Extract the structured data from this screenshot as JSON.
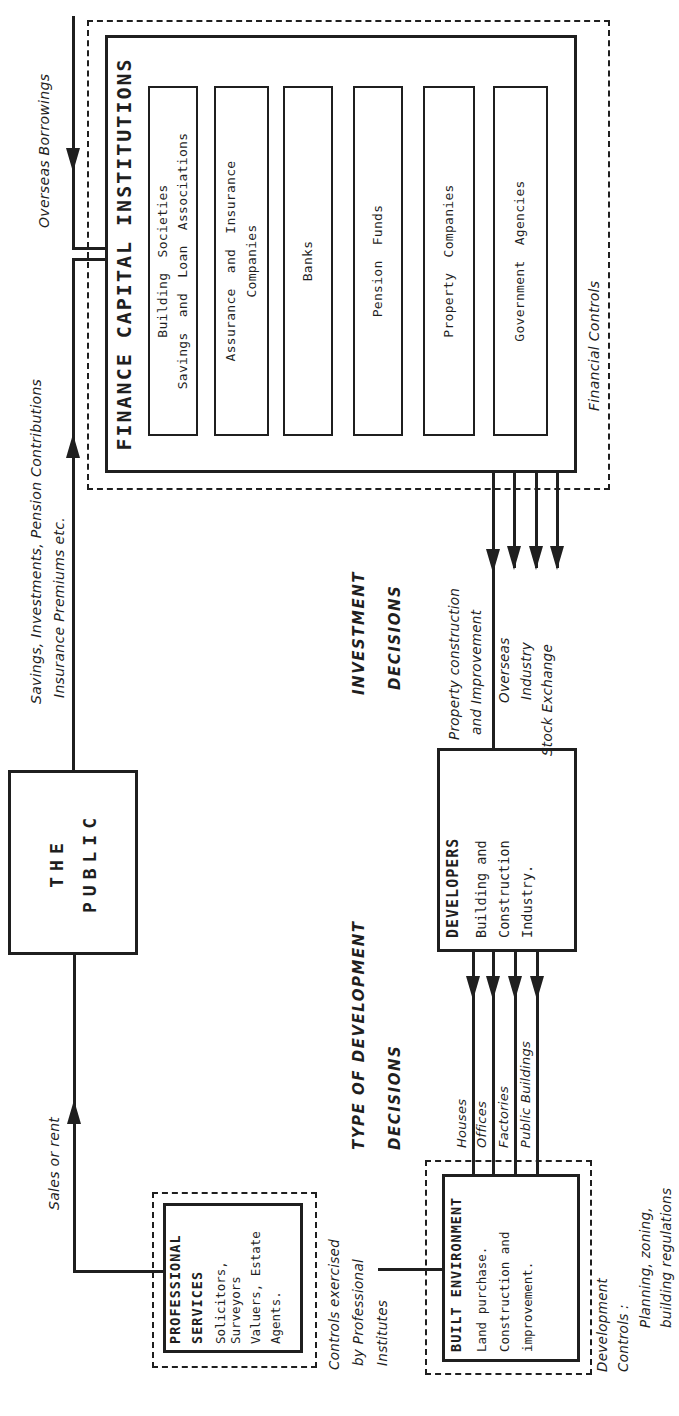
{
  "colors": {
    "ink": "#1f1f1f",
    "paper": "#ffffff"
  },
  "public_box": {
    "line1": "THE",
    "line2": "PUBLIC"
  },
  "fci": {
    "title": "FINANCE CAPITAL INSTITUTIONS",
    "outer_label": "Financial Controls",
    "sub_boxes": [
      {
        "line1": "Building Societies",
        "line2": "Savings and Loan Associations"
      },
      {
        "line1": "Assurance and Insurance",
        "line2": "Companies"
      },
      {
        "line1": "Banks"
      },
      {
        "line1": "Pension Funds"
      },
      {
        "line1": "Property Companies"
      },
      {
        "line1": "Government Agencies"
      }
    ]
  },
  "developers": {
    "title": "DEVELOPERS",
    "lines": [
      "Building and",
      "Construction",
      "Industry."
    ]
  },
  "professional": {
    "title_line1": "PROFESSIONAL",
    "title_line2": "SERVICES",
    "lines": [
      "Solicitors, Surveyors",
      "Valuers, Estate",
      "Agents."
    ]
  },
  "built_environment": {
    "title": "BUILT ENVIRONMENT",
    "lines": [
      "Land purchase.",
      "Construction and",
      "improvement."
    ]
  },
  "flow_labels": {
    "overseas_borrowings": "Overseas Borrowings",
    "savings_line1": "Savings, Investments, Pension Contributions",
    "savings_line2": "Insurance Premiums etc.",
    "sales_or_rent": "Sales or rent",
    "investment_line1": "INVESTMENT",
    "investment_line2": "DECISIONS",
    "type_line1": "TYPE OF DEVELOPMENT",
    "type_line2": "DECISIONS",
    "financial_controls": "Financial Controls"
  },
  "fci_outputs": {
    "property_line1": "Property construction",
    "property_line2": "and Improvement",
    "overseas": "Overseas",
    "industry": "Industry",
    "stock_exchange": "Stock Exchange"
  },
  "development_outputs": [
    "Houses",
    "Offices",
    "Factories",
    "Public Buildings"
  ],
  "notes": {
    "controls_exercised": [
      "Controls exercised",
      "by Professional",
      "Institutes"
    ],
    "development_controls": [
      "Development",
      "Controls :",
      "Planning, zoning,",
      "building regulations"
    ]
  }
}
